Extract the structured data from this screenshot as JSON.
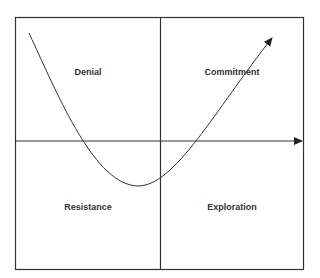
{
  "diagram": {
    "type": "quadrant-change-curve",
    "quadrants": {
      "top_left": "Denial",
      "top_right": "Commitment",
      "bottom_left": "Resistance",
      "bottom_right": "Exploration"
    },
    "colors": {
      "line": "#333333",
      "text": "#333333",
      "background": "#ffffff"
    }
  }
}
